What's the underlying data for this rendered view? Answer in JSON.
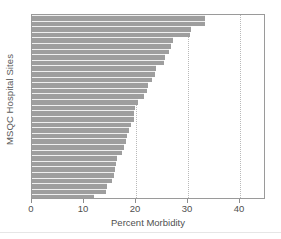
{
  "chart_data": {
    "type": "bar",
    "orientation": "horizontal",
    "title": "",
    "xlabel": "Percent Morbidity",
    "ylabel": "MSQC Hospital Sites",
    "xlim": [
      0,
      45
    ],
    "ylim": [
      0,
      33
    ],
    "xticks": [
      0,
      10,
      20,
      30,
      40
    ],
    "xtick_labels": [
      "0",
      "10",
      "20",
      "30",
      "40"
    ],
    "ytick_labels": [],
    "gridlines": {
      "x": [
        10,
        20,
        30,
        40
      ],
      "y": []
    },
    "grid": true,
    "legend": null,
    "bar_color": "#9e9e9e",
    "categories": [
      "Site 1",
      "Site 2",
      "Site 3",
      "Site 4",
      "Site 5",
      "Site 6",
      "Site 7",
      "Site 8",
      "Site 9",
      "Site 10",
      "Site 11",
      "Site 12",
      "Site 13",
      "Site 14",
      "Site 15",
      "Site 16",
      "Site 17",
      "Site 18",
      "Site 19",
      "Site 20",
      "Site 21",
      "Site 22",
      "Site 23",
      "Site 24",
      "Site 25",
      "Site 26",
      "Site 27",
      "Site 28",
      "Site 29",
      "Site 30",
      "Site 31",
      "Site 32",
      "Site 33"
    ],
    "values": [
      33.3,
      33.2,
      30.6,
      30.4,
      27.2,
      26.8,
      26.3,
      25.6,
      25.3,
      23.8,
      23.6,
      23.0,
      22.4,
      22.2,
      21.6,
      20.4,
      19.8,
      19.7,
      19.6,
      19.0,
      18.6,
      18.3,
      18.0,
      17.6,
      17.4,
      16.3,
      16.2,
      16.0,
      15.8,
      15.4,
      14.4,
      14.2,
      12.0
    ]
  }
}
